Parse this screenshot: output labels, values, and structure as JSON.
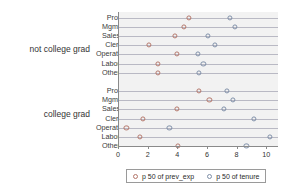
{
  "chart_data": {
    "type": "scatter",
    "title": "",
    "subtitle": "",
    "xlabel": "",
    "ylabel": "",
    "xlim": [
      0,
      10.8
    ],
    "xticks": [
      0,
      2,
      4,
      6,
      8,
      10
    ],
    "xtick_labels": [
      "0",
      "2",
      "4",
      "6",
      "8",
      "10"
    ],
    "grid": true,
    "grid_orientation": "horizontal",
    "legend_position": "bottom",
    "legend": [
      {
        "key": "prev_exp",
        "label": "p 50 of prev_exp",
        "color": "#b4776b",
        "marker": "open-circle"
      },
      {
        "key": "tenure",
        "label": "p 50 of tenure",
        "color": "#7f8fa8",
        "marker": "open-circle"
      }
    ],
    "groups": [
      {
        "name": "not college grad",
        "categories": [
          "Prof",
          "Mgmt",
          "Sales",
          "Cler.",
          "Operat.",
          "Labor",
          "Other"
        ],
        "series": [
          {
            "name": "p 50 of prev_exp",
            "key": "prev_exp",
            "values": [
              4.7,
              4.4,
              3.8,
              2.0,
              3.9,
              2.6,
              2.6
            ]
          },
          {
            "name": "p 50 of tenure",
            "key": "tenure",
            "values": [
              7.5,
              7.8,
              6.0,
              6.5,
              5.3,
              5.7,
              5.4
            ]
          }
        ]
      },
      {
        "name": "college grad",
        "categories": [
          "Prof",
          "Mgmt",
          "Sales",
          "Cler.",
          "Operat.",
          "Labor",
          "Other"
        ],
        "series": [
          {
            "name": "p 50 of prev_exp",
            "key": "prev_exp",
            "values": [
              5.4,
              6.1,
              3.9,
              1.6,
              0.5,
              1.4,
              4.0
            ]
          },
          {
            "name": "p 50 of tenure",
            "key": "tenure",
            "values": [
              7.3,
              7.7,
              7.1,
              9.1,
              3.4,
              10.2,
              8.6
            ]
          }
        ]
      }
    ]
  }
}
